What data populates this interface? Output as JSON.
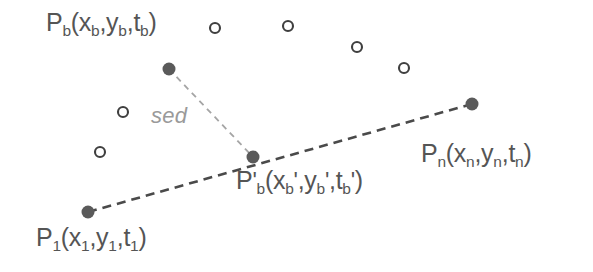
{
  "figure": {
    "type": "diagram",
    "background_color": "#ffffff",
    "width": 593,
    "height": 272
  },
  "labels": {
    "p_b": {
      "base": "P",
      "sub": "b",
      "args": "(x",
      "full_text": "P_b(x_b,y_b,t_b)",
      "x": 46,
      "y": 10,
      "color": "#555555"
    },
    "p_b_prime": {
      "full_text": "P'_b(x_b',y_b',t_b')",
      "x": 236,
      "y": 168,
      "color": "#555555"
    },
    "p_n": {
      "full_text": "P_n(x_n,y_n,t_n)",
      "x": 421,
      "y": 141,
      "color": "#555555"
    },
    "p_1": {
      "full_text": "P_1(x_1,y_1,t_1)",
      "x": 36,
      "y": 225,
      "color": "#555555"
    },
    "sed": {
      "text": "sed",
      "x": 151,
      "y": 105,
      "color": "#9a9a9a"
    }
  },
  "label_parts": {
    "p_b": {
      "p": "P",
      "sub1": "b",
      "open": "(x",
      "sub2": "b",
      "comma1": ",y",
      "sub3": "b",
      "comma2": ",t",
      "sub4": "b",
      "close": ")"
    },
    "p_b_prime": {
      "p": "P",
      "prime1": "'",
      "sub1": "b",
      "open": "(x",
      "sub2": "b",
      "prime2": "'",
      "comma1": ",y",
      "sub3": "b",
      "prime3": "'",
      "comma2": ",t",
      "sub4": "b",
      "prime4": "'",
      "close": ")"
    },
    "p_n": {
      "p": "P",
      "sub1": "n",
      "open": "(x",
      "sub2": "n",
      "comma1": ",y",
      "sub3": "n",
      "comma2": ",t",
      "sub4": "n",
      "close": ")"
    },
    "p_1": {
      "p": "P",
      "sub1": "1",
      "open": "(x",
      "sub2": "1",
      "comma1": ",y",
      "sub3": "1",
      "comma2": ",t",
      "sub4": "1",
      "close": ")"
    }
  },
  "chart_data": {
    "type": "scatter",
    "title": "",
    "filled_points": [
      {
        "name": "P_b",
        "x": 169,
        "y": 69,
        "r": 6.5,
        "color": "#5a5a5a"
      },
      {
        "name": "P_b_prime",
        "x": 253,
        "y": 157,
        "r": 6.5,
        "color": "#5a5a5a"
      },
      {
        "name": "P_n",
        "x": 472,
        "y": 104,
        "r": 6.5,
        "color": "#5a5a5a"
      },
      {
        "name": "P_1",
        "x": 88,
        "y": 212,
        "r": 6.5,
        "color": "#5a5a5a"
      }
    ],
    "hollow_points": [
      {
        "x": 215,
        "y": 28,
        "r": 5,
        "color": "#3f3f3f"
      },
      {
        "x": 288,
        "y": 26,
        "r": 5,
        "color": "#3f3f3f"
      },
      {
        "x": 357,
        "y": 47,
        "r": 5,
        "color": "#3f3f3f"
      },
      {
        "x": 404,
        "y": 68,
        "r": 5,
        "color": "#3f3f3f"
      },
      {
        "x": 123,
        "y": 112,
        "r": 5,
        "color": "#3f3f3f"
      },
      {
        "x": 100,
        "y": 152,
        "r": 5,
        "color": "#3f3f3f"
      }
    ],
    "lines": [
      {
        "name": "trajectory-baseline",
        "from": "P_1",
        "to": "P_n",
        "x1": 88,
        "y1": 212,
        "x2": 472,
        "y2": 104,
        "style": "dashed",
        "color": "#4a4a4a",
        "width": 2.6,
        "dash": "9,6"
      },
      {
        "name": "sed-distance",
        "from": "P_b",
        "to": "P_b_prime",
        "x1": 169,
        "y1": 69,
        "x2": 253,
        "y2": 157,
        "style": "dashed",
        "color": "#a5a5a5",
        "width": 1.8,
        "dash": "6,5"
      }
    ],
    "legend": [],
    "annotations": [
      {
        "text": "sed",
        "x": 151,
        "y": 105
      }
    ],
    "grid": false
  }
}
